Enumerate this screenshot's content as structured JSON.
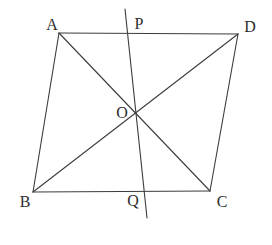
{
  "figure": {
    "kind": "parallelogram-with-diagonals-and-transversal",
    "canvas": {
      "width": 272,
      "height": 245
    },
    "background": "#ffffff",
    "stroke_color": "#3c3c3c",
    "stroke_width": 1.1,
    "label_color": "#2d2d2d",
    "vertices": {
      "A": [
        59,
        33
      ],
      "B": [
        33,
        192
      ],
      "C": [
        210,
        191
      ],
      "D": [
        238,
        34
      ]
    },
    "intersection_point": {
      "label": "O",
      "x": 135.5,
      "y": 112.5
    },
    "edges": [
      {
        "from": "A",
        "to": "D",
        "name": "side-AD"
      },
      {
        "from": "B",
        "to": "C",
        "name": "side-BC"
      },
      {
        "from": "A",
        "to": "B",
        "name": "side-AB"
      },
      {
        "from": "D",
        "to": "C",
        "name": "side-DC"
      },
      {
        "from": "A",
        "to": "C",
        "name": "diagonal-AC"
      },
      {
        "from": "B",
        "to": "D",
        "name": "diagonal-BD"
      }
    ],
    "transversal": {
      "name": "line-PQ",
      "from": [
        125,
        9
      ],
      "to": [
        147,
        218
      ]
    },
    "labels": [
      {
        "text": "A",
        "x": 52,
        "y": 24
      },
      {
        "text": "P",
        "x": 139,
        "y": 23
      },
      {
        "text": "D",
        "x": 250,
        "y": 26
      },
      {
        "text": "O",
        "x": 122,
        "y": 112
      },
      {
        "text": "B",
        "x": 25,
        "y": 201
      },
      {
        "text": "Q",
        "x": 133,
        "y": 200
      },
      {
        "text": "C",
        "x": 222,
        "y": 201
      }
    ]
  }
}
